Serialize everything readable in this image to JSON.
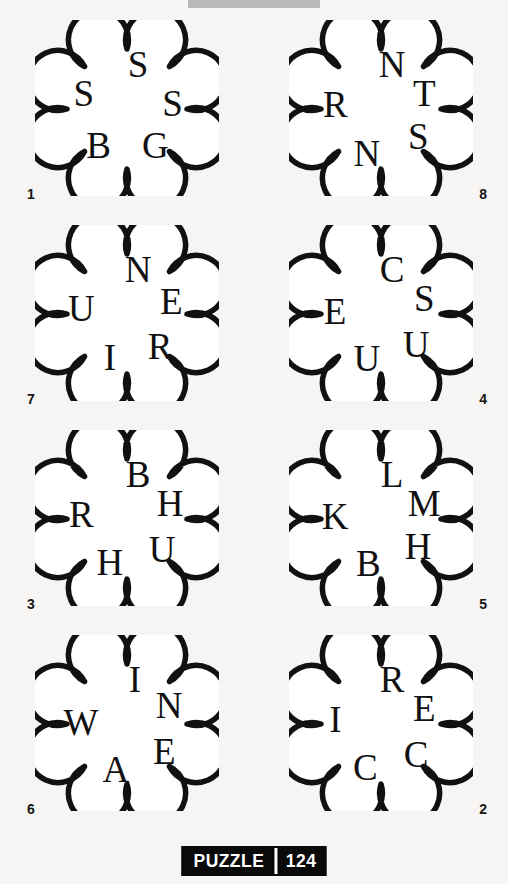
{
  "page": {
    "background_color": "#f6f5f3",
    "ink_color": "#111111"
  },
  "top_banner": {
    "visible_fragment": "",
    "background_color": "#b9b9b9"
  },
  "footer": {
    "label": "PUZZLE",
    "number": "124",
    "background_color": "#0a0a0a",
    "text_color": "#ffffff"
  },
  "puzzle": {
    "shape": "eight-lobed-cloud",
    "letters_per_cloud": 5,
    "clouds": [
      {
        "number": "1",
        "number_side": "left",
        "letters": [
          "S",
          "S",
          "G",
          "B",
          "S"
        ],
        "letter_angles": [
          -76,
          -8,
          52,
          128,
          200
        ]
      },
      {
        "number": "8",
        "number_side": "right",
        "letters": [
          "N",
          "T",
          "S",
          "N",
          "R"
        ],
        "letter_angles": [
          -76,
          -20,
          36,
          108,
          186
        ]
      },
      {
        "number": "7",
        "number_side": "left",
        "letters": [
          "N",
          "E",
          "R",
          "I",
          "U"
        ],
        "letter_angles": [
          -76,
          -16,
          44,
          112,
          188
        ]
      },
      {
        "number": "4",
        "number_side": "right",
        "letters": [
          "C",
          "S",
          "U",
          "U",
          "E"
        ],
        "letter_angles": [
          -76,
          -20,
          40,
          108,
          184
        ]
      },
      {
        "number": "3",
        "number_side": "left",
        "letters": [
          "B",
          "H",
          "U",
          "H",
          "R"
        ],
        "letter_angles": [
          -76,
          -20,
          40,
          112,
          186
        ]
      },
      {
        "number": "5",
        "number_side": "right",
        "letters": [
          "L",
          "M",
          "H",
          "B",
          "K"
        ],
        "letter_angles": [
          -76,
          -20,
          36,
          106,
          184
        ]
      },
      {
        "number": "6",
        "number_side": "left",
        "letters": [
          "I",
          "N",
          "E",
          "A",
          "W"
        ],
        "letter_angles": [
          -80,
          -24,
          36,
          104,
          182
        ]
      },
      {
        "number": "2",
        "number_side": "right",
        "letters": [
          "R",
          "E",
          "C",
          "C",
          "I"
        ],
        "letter_angles": [
          -76,
          -20,
          40,
          110,
          186
        ]
      }
    ]
  }
}
